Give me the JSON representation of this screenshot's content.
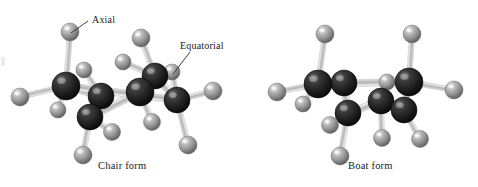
{
  "figure": {
    "background": "#ffffff",
    "annotations": [
      {
        "id": "axial",
        "label": "Axial"
      },
      {
        "id": "equatorial",
        "label": "Equatorial"
      }
    ],
    "captions": {
      "chair": "Chair form",
      "boat": "Boat form"
    }
  },
  "palette": {
    "carbon": "#262626",
    "carbon_highlight": "#8a8a8a",
    "carbon_dark": "#0b0b0b",
    "hydrogen": "#9a9a9a",
    "hydrogen_highlight": "#e8e8e8",
    "hydrogen_dark": "#5c5c5c",
    "bond": "#b9b9b9",
    "bond_edge": "#ffffff",
    "text": "#1a1a1a",
    "leader": "#2a2a2a"
  },
  "models": {
    "chair": {
      "name": "Chair form",
      "carbon_radius": 13,
      "hydrogen_radius": 8.5,
      "carbons": [
        {
          "id": "C1",
          "x": 66,
          "y": 86,
          "r": 14
        },
        {
          "id": "C2",
          "x": 101,
          "y": 96,
          "r": 13
        },
        {
          "id": "C3",
          "x": 90,
          "y": 117,
          "r": 13
        },
        {
          "id": "C4",
          "x": 140,
          "y": 92,
          "r": 14
        },
        {
          "id": "C5",
          "x": 155,
          "y": 76,
          "r": 13
        },
        {
          "id": "C6",
          "x": 177,
          "y": 100,
          "r": 13
        }
      ],
      "ring_bonds": [
        [
          "C1",
          "C2"
        ],
        [
          "C2",
          "C3"
        ],
        [
          "C3",
          "C4"
        ],
        [
          "C4",
          "C5"
        ],
        [
          "C5",
          "C6"
        ],
        [
          "C6",
          "C1"
        ]
      ],
      "hydrogens": [
        {
          "id": "H-axial-up-left",
          "x": 70,
          "y": 32,
          "r": 9,
          "bond_to": "C1",
          "type": "axial"
        },
        {
          "id": "H-eq-left",
          "x": 20,
          "y": 97,
          "r": 9,
          "bond_to": "C1",
          "type": "equatorial"
        },
        {
          "id": "H-eq-lower-left",
          "x": 58,
          "y": 110,
          "r": 8,
          "bond_to": "C1",
          "type": "equatorial"
        },
        {
          "id": "H-eq-c2",
          "x": 84,
          "y": 70,
          "r": 8,
          "bond_to": "C2",
          "type": "equatorial"
        },
        {
          "id": "H-ax-c3-down",
          "x": 83,
          "y": 155,
          "r": 9,
          "bond_to": "C3",
          "type": "axial"
        },
        {
          "id": "H-eq-c3",
          "x": 112,
          "y": 132,
          "r": 8.5,
          "bond_to": "C3",
          "type": "equatorial"
        },
        {
          "id": "H-ax-c5-up",
          "x": 141,
          "y": 38,
          "r": 9,
          "bond_to": "C5",
          "type": "axial"
        },
        {
          "id": "H-eq-c5",
          "x": 123,
          "y": 62,
          "r": 8,
          "bond_to": "C5",
          "type": "equatorial"
        },
        {
          "id": "H-eq-c4",
          "x": 152,
          "y": 122,
          "r": 8.5,
          "bond_to": "C4",
          "type": "equatorial"
        },
        {
          "id": "H-eq-c6-right",
          "x": 213,
          "y": 91,
          "r": 9,
          "bond_to": "C6",
          "type": "equatorial"
        },
        {
          "id": "H-eq-c6-upper",
          "x": 172,
          "y": 72,
          "r": 8,
          "bond_to": "C6",
          "type": "equatorial"
        },
        {
          "id": "H-ax-c6-down",
          "x": 188,
          "y": 145,
          "r": 9,
          "bond_to": "C6",
          "type": "axial"
        }
      ]
    },
    "boat": {
      "name": "Boat form",
      "carbons": [
        {
          "id": "B1",
          "x": 318,
          "y": 84,
          "r": 14
        },
        {
          "id": "B2",
          "x": 344,
          "y": 83,
          "r": 13
        },
        {
          "id": "B3",
          "x": 348,
          "y": 113,
          "r": 13
        },
        {
          "id": "B4",
          "x": 381,
          "y": 101,
          "r": 13
        },
        {
          "id": "B5",
          "x": 404,
          "y": 110,
          "r": 13
        },
        {
          "id": "B6",
          "x": 409,
          "y": 82,
          "r": 14
        }
      ],
      "ring_bonds": [
        [
          "B1",
          "B2"
        ],
        [
          "B2",
          "B3"
        ],
        [
          "B3",
          "B4"
        ],
        [
          "B4",
          "B5"
        ],
        [
          "B5",
          "B6"
        ],
        [
          "B6",
          "B1"
        ]
      ],
      "hydrogens": [
        {
          "id": "HB-ax-left-up",
          "x": 325,
          "y": 34,
          "r": 9,
          "bond_to": "B1",
          "type": "axial"
        },
        {
          "id": "HB-eq-left",
          "x": 277,
          "y": 92,
          "r": 9,
          "bond_to": "B1",
          "type": "equatorial"
        },
        {
          "id": "HB-eq-lowleft",
          "x": 303,
          "y": 104,
          "r": 8,
          "bond_to": "B1",
          "type": "equatorial"
        },
        {
          "id": "HB-eq-b3-left",
          "x": 330,
          "y": 125,
          "r": 8.5,
          "bond_to": "B3",
          "type": "equatorial"
        },
        {
          "id": "HB-ax-b3-down",
          "x": 340,
          "y": 156,
          "r": 9,
          "bond_to": "B3",
          "type": "axial"
        },
        {
          "id": "HB-eq-b4-up",
          "x": 387,
          "y": 82,
          "r": 8,
          "bond_to": "B4",
          "type": "equatorial"
        },
        {
          "id": "HB-ax-b4-down",
          "x": 382,
          "y": 138,
          "r": 8.5,
          "bond_to": "B4",
          "type": "axial"
        },
        {
          "id": "HB-ax-b5-down",
          "x": 420,
          "y": 139,
          "r": 8.5,
          "bond_to": "B5",
          "type": "axial"
        },
        {
          "id": "HB-ax-right-up",
          "x": 412,
          "y": 34,
          "r": 9,
          "bond_to": "B6",
          "type": "axial"
        },
        {
          "id": "HB-eq-right",
          "x": 454,
          "y": 90,
          "r": 9,
          "bond_to": "B6",
          "type": "equatorial"
        }
      ]
    }
  },
  "leaders": {
    "axial": {
      "x1": 88,
      "y1": 21,
      "x2": 71,
      "y2": 33
    },
    "equatorial": {
      "x1": 190,
      "y1": 52,
      "x2": 173,
      "y2": 74
    }
  }
}
